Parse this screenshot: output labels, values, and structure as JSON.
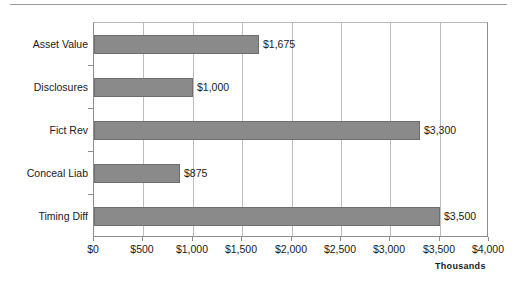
{
  "chart_data": {
    "type": "bar",
    "orientation": "horizontal",
    "title": "",
    "xlabel": "",
    "ylabel": "",
    "units_label": "Thousands",
    "categories": [
      "Asset Value",
      "Disclosures",
      "Fict Rev",
      "Conceal Liab",
      "Timing Diff"
    ],
    "values": [
      1675,
      1000,
      3300,
      875,
      3500
    ],
    "data_labels": [
      "$1,675",
      "$1,000",
      "$3,300",
      "$875",
      "$3,500"
    ],
    "xlim": [
      0,
      4000
    ],
    "xticks": [
      0,
      500,
      1000,
      1500,
      2000,
      2500,
      3000,
      3500,
      4000
    ],
    "xticklabels": [
      "$0",
      "$500",
      "$1,000",
      "$1,500",
      "$2,000",
      "$2,500",
      "$3,000",
      "$3,500",
      "$4,000"
    ],
    "grid": true,
    "grid_axis": "x",
    "legend": false,
    "series": [
      {
        "name": "Amount",
        "values": [
          1675,
          1000,
          3300,
          875,
          3500
        ],
        "color": "#8a8a8a"
      }
    ],
    "colors": {
      "bar_fill": "#8a8a8a",
      "bar_border": "#6e6e6e",
      "gridline": "#bdbdbd",
      "axis": "#8d8d8d",
      "text": "#1a1a1a",
      "background": "#ffffff"
    }
  }
}
